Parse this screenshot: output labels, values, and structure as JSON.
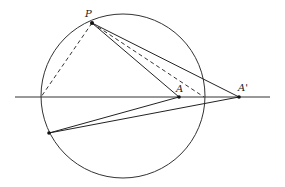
{
  "diagram": {
    "type": "geometry-construction",
    "circle": {
      "cx": 123,
      "cy": 96,
      "r": 82,
      "stroke": "#333333"
    },
    "line": {
      "x1": 15,
      "y1": 97,
      "x2": 270,
      "y2": 97
    },
    "points": {
      "P": {
        "x": 92,
        "y": 23,
        "label": "P",
        "lx": 85,
        "ly": 17
      },
      "A": {
        "x": 179,
        "y": 97,
        "label": "A",
        "lx": 176,
        "ly": 92
      },
      "A_prime": {
        "x": 239,
        "y": 97,
        "label": "A'",
        "lx": 238,
        "ly": 91
      },
      "Q": {
        "x": 49,
        "y": 133,
        "label": ""
      },
      "L": {
        "x": 41,
        "y": 97,
        "label": ""
      },
      "R": {
        "x": 204,
        "y": 97,
        "label": ""
      }
    },
    "solid_segments": [
      [
        "P",
        "A"
      ],
      [
        "P",
        "A_prime"
      ],
      [
        "Q",
        "A"
      ],
      [
        "Q",
        "A_prime"
      ]
    ],
    "dashed_segments": [
      [
        "P",
        "L"
      ],
      [
        "P",
        "R"
      ]
    ],
    "labels": {
      "P": "P",
      "A": "A",
      "A_prime": "A'"
    }
  }
}
